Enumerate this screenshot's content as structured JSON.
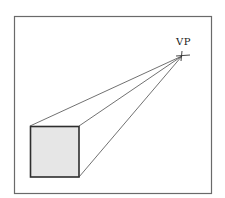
{
  "diagram": {
    "vanishing_point": {
      "label": "VP",
      "x": 182,
      "y": 56
    },
    "frame": {
      "x": 14,
      "y": 16,
      "width": 198,
      "height": 178
    },
    "square": {
      "x": 30,
      "y": 126,
      "width": 49,
      "height": 51,
      "fill": "#e6e6e6",
      "stroke": "#333333"
    },
    "colors": {
      "frame_stroke": "#666666",
      "line_stroke": "#333333",
      "background": "#ffffff"
    }
  }
}
